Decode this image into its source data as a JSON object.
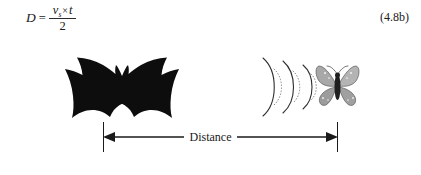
{
  "figure": {
    "caption_text": "Bat echolocation distance figure",
    "background_color": "#ffffff",
    "ink_color": "#1a1a1a"
  },
  "equation": {
    "lhs": "D",
    "equals": "=",
    "numerator_variable": "v",
    "numerator_subscript": "s",
    "numerator_operator": "×",
    "numerator_variable2": "t",
    "denominator": "2",
    "number": "(4.8b)"
  },
  "illustration": {
    "bat_label": "bat-silhouette",
    "waves_label": "sound-wave-arcs",
    "wave_arc_count": 3,
    "moth_label": "moth",
    "moth_color": "#8a8a8a",
    "bat_color": "#0d0d0d"
  },
  "measure": {
    "label": "Distance",
    "arrow_style": "double-headed",
    "tick_count": 2
  }
}
